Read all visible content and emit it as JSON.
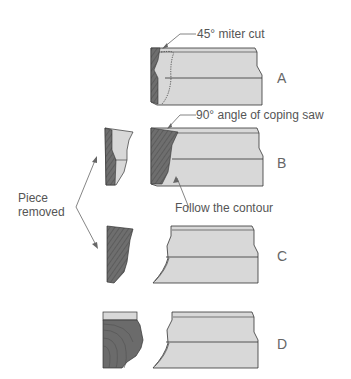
{
  "diagram": {
    "annotations": {
      "miter": "45° miter cut",
      "coping": "90° angle of coping saw",
      "contour": "Follow the contour",
      "piece_line1": "Piece",
      "piece_line2": "removed"
    },
    "steps": [
      {
        "label": "A",
        "description": "Molding with 45° miter cut, profile traced as dotted line"
      },
      {
        "label": "B",
        "description": "Coping saw cut at 90° following contour; piece removed"
      },
      {
        "label": "C",
        "description": "Coped end with waste piece removed"
      },
      {
        "label": "D",
        "description": "Coped molding with profile end piece"
      }
    ],
    "colors": {
      "molding_face": "#d9d9d9",
      "end_grain": "#6b6b6b",
      "outline": "#333333",
      "text": "#555555"
    }
  }
}
